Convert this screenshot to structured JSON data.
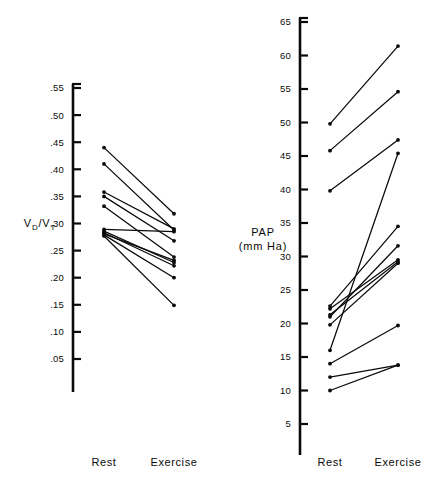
{
  "figure": {
    "background_color": "#ffffff",
    "ink_color": "#0a0a0a"
  },
  "chart_data": [
    {
      "type": "line",
      "panel": "left",
      "title": "",
      "ylabel": "V_D/V_T",
      "ylabel_main": "V",
      "ylabel_sub1": "D",
      "ylabel_slash": "/V",
      "ylabel_sub2": "T",
      "xlabel": "",
      "categories": [
        "Rest",
        "Exercise"
      ],
      "tick_labels": [
        ".55",
        ".50",
        ".45",
        ".40",
        ".35",
        ".30",
        ".25",
        ".20",
        ".15",
        ".10",
        ".05"
      ],
      "tick_values": [
        0.55,
        0.5,
        0.45,
        0.4,
        0.35,
        0.3,
        0.25,
        0.2,
        0.15,
        0.1,
        0.05
      ],
      "ylim": [
        0.02,
        0.55
      ],
      "grid": false,
      "legend": "none",
      "series": [
        {
          "name": "subject-1",
          "values": [
            0.44,
            0.318
          ]
        },
        {
          "name": "subject-2",
          "values": [
            0.41,
            0.288
          ]
        },
        {
          "name": "subject-3",
          "values": [
            0.358,
            0.29
          ]
        },
        {
          "name": "subject-4",
          "values": [
            0.35,
            0.268
          ]
        },
        {
          "name": "subject-5",
          "values": [
            0.332,
            0.238
          ]
        },
        {
          "name": "subject-6",
          "values": [
            0.289,
            0.285
          ]
        },
        {
          "name": "subject-7",
          "values": [
            0.286,
            0.228
          ]
        },
        {
          "name": "subject-8",
          "values": [
            0.283,
            0.222
          ]
        },
        {
          "name": "subject-9",
          "values": [
            0.281,
            0.232
          ]
        },
        {
          "name": "subject-10",
          "values": [
            0.279,
            0.2
          ]
        },
        {
          "name": "subject-11",
          "values": [
            0.277,
            0.149
          ]
        }
      ]
    },
    {
      "type": "line",
      "panel": "right",
      "title": "",
      "ylabel": "PAP (mm Ha)",
      "ylabel_line1": "PAP",
      "ylabel_line2": "(mm Ha)",
      "xlabel": "",
      "categories": [
        "Rest",
        "Exercise"
      ],
      "tick_labels": [
        "65",
        "60",
        "55",
        "50",
        "45",
        "40",
        "35",
        "30",
        "25",
        "20",
        "15",
        "10",
        "5"
      ],
      "tick_values": [
        65,
        60,
        55,
        50,
        45,
        40,
        35,
        30,
        25,
        20,
        15,
        10,
        5
      ],
      "ylim": [
        2,
        65
      ],
      "grid": false,
      "legend": "none",
      "series": [
        {
          "name": "subject-1",
          "values": [
            49.8,
            61.4
          ]
        },
        {
          "name": "subject-2",
          "values": [
            45.8,
            54.6
          ]
        },
        {
          "name": "subject-3",
          "values": [
            39.8,
            47.4
          ]
        },
        {
          "name": "subject-4",
          "values": [
            16.0,
            45.4
          ]
        },
        {
          "name": "subject-5",
          "values": [
            22.6,
            34.5
          ]
        },
        {
          "name": "subject-6",
          "values": [
            21.0,
            31.6
          ]
        },
        {
          "name": "subject-7",
          "values": [
            22.2,
            29.5
          ]
        },
        {
          "name": "subject-8",
          "values": [
            21.3,
            29.2
          ]
        },
        {
          "name": "subject-9",
          "values": [
            19.8,
            29.0
          ]
        },
        {
          "name": "subject-10",
          "values": [
            14.0,
            19.7
          ]
        },
        {
          "name": "subject-11",
          "values": [
            10.0,
            13.8
          ]
        },
        {
          "name": "subject-12",
          "values": [
            12.0,
            13.8
          ]
        }
      ]
    }
  ]
}
